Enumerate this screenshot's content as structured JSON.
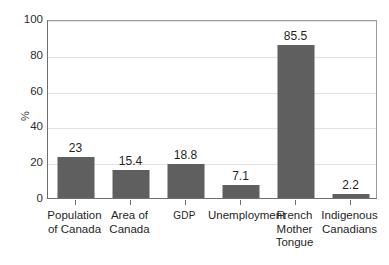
{
  "chart_data": {
    "type": "bar",
    "title": "",
    "subtitle": "",
    "xlabel": "",
    "ylabel": "%",
    "ylim": [
      0,
      100
    ],
    "yticks": [
      0,
      20,
      40,
      60,
      80,
      100
    ],
    "ytick_labels": [
      "0",
      "20",
      "40",
      "60",
      "80",
      "100"
    ],
    "grid": "horizontal",
    "legend": "none",
    "bar_color": "#5f5f5f",
    "categories": [
      "Population of Canada",
      "Area of Canada",
      "GDP",
      "Unemployment",
      "French Mother Tongue",
      "Indigenous Canadians"
    ],
    "category_lines": [
      [
        "Population",
        "of Canada"
      ],
      [
        "Area of",
        "Canada"
      ],
      [
        "GDP"
      ],
      [
        "Unemployment"
      ],
      [
        "French",
        "Mother",
        "Tongue"
      ],
      [
        "Indigenous",
        "Canadians"
      ]
    ],
    "values": [
      23,
      15.4,
      18.8,
      7.1,
      85.5,
      2.2
    ],
    "value_labels": [
      "23",
      "15.4",
      "18.8",
      "7.1",
      "85.5",
      "2.2"
    ]
  },
  "axis": {
    "y_title": "%"
  },
  "colors": {
    "bar": "#5f5f5f",
    "axis": "#6e6e6e",
    "grid": "#e2e2e2",
    "text": "#1f1f1f",
    "background": "#ffffff"
  }
}
